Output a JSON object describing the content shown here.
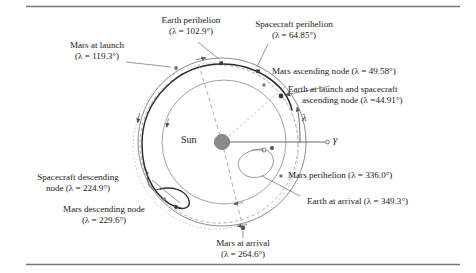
{
  "figure": {
    "type": "orbital-diagram",
    "center_body": "Sun",
    "reference_direction": "gamma",
    "angle_symbol": "lambda"
  },
  "center": {
    "sun_label": "Sun",
    "vernal_equinox_symbol": "γ",
    "angle_label": "λ"
  },
  "annotations": {
    "mars_at_launch": {
      "line1": "Mars at launch",
      "line2": "(λ = 119.3°)",
      "lambda": 119.3
    },
    "earth_perihelion": {
      "line1": "Earth perihelion",
      "line2": "(λ = 102.9°)",
      "lambda": 102.9
    },
    "spacecraft_perihelion": {
      "line1": "Spacecraft perihelion",
      "line2": "(λ = 64.85°)",
      "lambda": 64.85
    },
    "mars_ascending_node": {
      "line1": "Mars ascending node (λ = 49.58°)",
      "lambda": 49.58
    },
    "earth_launch_sc_ascending_node": {
      "line1": "Earth at launch and spacecraft",
      "line2": "ascending node (λ =44.91°)",
      "lambda": 44.91
    },
    "mars_perihelion": {
      "line1": "Mars perihelion (λ = 336.0°)",
      "lambda": 336.0
    },
    "earth_at_arrival": {
      "line1": "Earth at arrival (λ = 349.3°)",
      "lambda": 349.3
    },
    "spacecraft_descending_node": {
      "line1": "Spacecraft descending",
      "line2": "node (λ = 224.9°)",
      "lambda": 224.9
    },
    "mars_descending_node": {
      "line1": "Mars descending node",
      "line2": "(λ = 229.6°)",
      "lambda": 229.6
    },
    "mars_at_arrival": {
      "line1": "Mars at arrival",
      "line2": "(λ = 264.6°)",
      "lambda": 264.6
    }
  },
  "colors": {
    "ink": "#1a1a1a",
    "orbit_line": "#6b6b6b",
    "trajectory_line": "#333333",
    "sun_fill": "#8a8a8a",
    "rule": "#777777"
  }
}
